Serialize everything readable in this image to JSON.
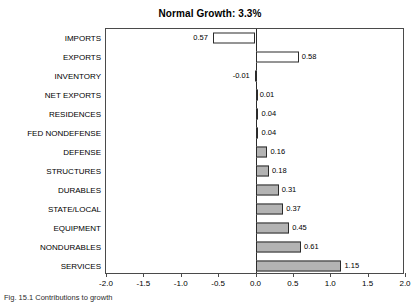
{
  "chart_data": {
    "type": "bar",
    "orientation": "horizontal",
    "title": "Normal Growth: 3.3%",
    "xlabel": "",
    "ylabel": "",
    "xlim": [
      -2.0,
      2.0
    ],
    "xticks": [
      "-2.0",
      "-1.5",
      "-1.0",
      "-0.5",
      "0.0",
      "0.5",
      "1.0",
      "1.5",
      "2.0"
    ],
    "xtick_values": [
      -2.0,
      -1.5,
      -1.0,
      -0.5,
      0.0,
      0.5,
      1.0,
      1.5,
      2.0
    ],
    "grid": false,
    "legend": false,
    "zero_line": true,
    "categories": [
      "IMPORTS",
      "EXPORTS",
      "INVENTORY",
      "NET EXPORTS",
      "RESIDENCES",
      "FED NONDEFENSE",
      "DEFENSE",
      "STRUCTURES",
      "DURABLES",
      "STATE/LOCAL",
      "EQUIPMENT",
      "NONDURABLES",
      "SERVICES"
    ],
    "values": [
      -0.57,
      0.58,
      -0.01,
      0.01,
      0.04,
      0.04,
      0.16,
      0.18,
      0.31,
      0.37,
      0.45,
      0.61,
      1.15
    ],
    "value_labels": [
      "0.57",
      "0.58",
      "-0.01",
      "0.01",
      "0.04",
      "0.04",
      "0.16",
      "0.18",
      "0.31",
      "0.37",
      "0.45",
      "0.61",
      "1.15"
    ],
    "bar_fills": [
      "hollow",
      "hollow",
      "hollow",
      "filled",
      "filled",
      "filled",
      "filled",
      "filled",
      "filled",
      "filled",
      "filled",
      "filled",
      "filled"
    ],
    "colors": {
      "bar_fill": "#b3b3b3",
      "bar_hollow": "#ffffff",
      "bar_edge": "#2b2b2b",
      "axis": "#4a4a4a",
      "text": "#000000",
      "background": "#ffffff"
    }
  },
  "caption": "Fig. 15.1  Contributions to growth"
}
